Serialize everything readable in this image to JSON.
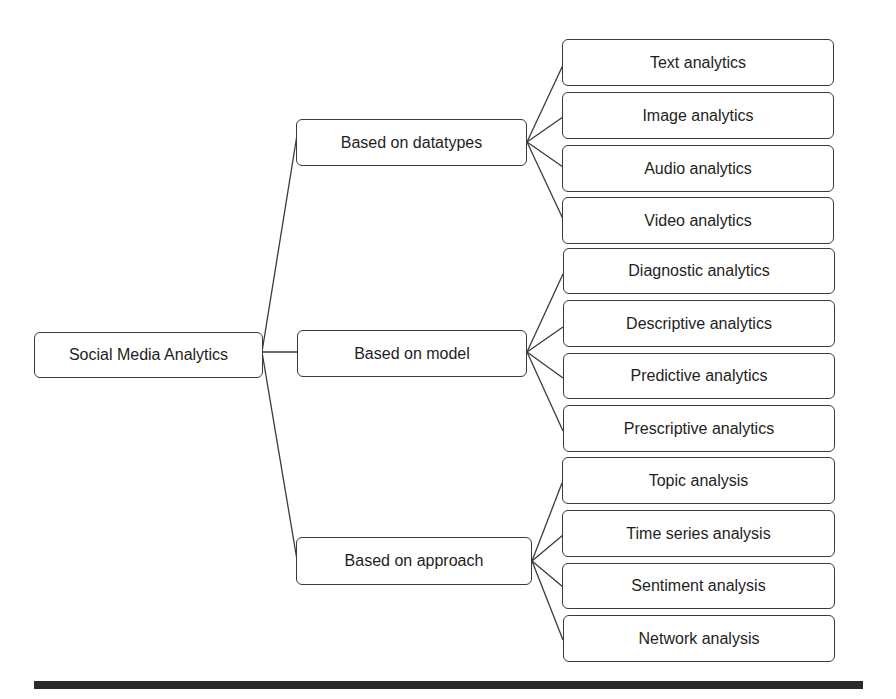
{
  "diagram": {
    "root": "Social Media Analytics",
    "branches": [
      {
        "label": "Based on datatypes",
        "children": [
          "Text analytics",
          "Image analytics",
          "Audio analytics",
          "Video analytics"
        ]
      },
      {
        "label": "Based on model",
        "children": [
          "Diagnostic analytics",
          "Descriptive analytics",
          "Predictive analytics",
          "Prescriptive analytics"
        ]
      },
      {
        "label": "Based on approach",
        "children": [
          "Topic analysis",
          "Time series analysis",
          "Sentiment analysis",
          "Network analysis"
        ]
      }
    ]
  }
}
